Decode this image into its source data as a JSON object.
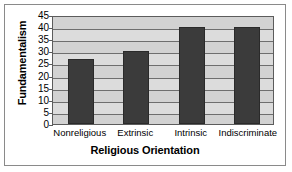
{
  "chart_data": {
    "type": "bar",
    "title": "",
    "categories": [
      "Nonreligious",
      "Extrinsic",
      "Intrinsic",
      "Indiscriminate"
    ],
    "values": [
      27,
      30,
      40,
      40
    ],
    "xlabel": "Religious Orientation",
    "ylabel": "Fundamentalism",
    "ylim": [
      0,
      45
    ],
    "yticks": [
      0,
      5,
      10,
      15,
      20,
      25,
      30,
      35,
      40,
      45
    ],
    "ytick_labels": [
      "0",
      "5",
      "10",
      "15",
      "20",
      "25",
      "30",
      "35",
      "40",
      "45"
    ],
    "grid": true,
    "legend": false,
    "legend_position": "none",
    "colors": {
      "bar": "#3b3b3b",
      "bar_edge": "#2a2a2a",
      "plot_background": "#d2d2d2",
      "gridline": "#6e6e6e",
      "axis": "#5c5c5c",
      "figure_border": "#8a8a8a",
      "text": "#000000",
      "page_background": "#ffffff"
    }
  }
}
